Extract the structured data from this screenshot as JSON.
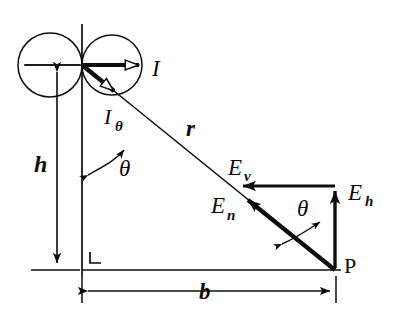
{
  "figure": {
    "type": "vector-geometry-diagram",
    "stroke_color": "#0d0d0d",
    "background_color": "#ffffff",
    "labels": {
      "current": "I",
      "current_theta_base": "I",
      "current_theta_sub": "θ",
      "radius": "r",
      "angle_upper": "θ",
      "angle_lower": "θ",
      "height": "h",
      "baseline": "b",
      "point": "P",
      "field_vertical_base": "E",
      "field_vertical_sub": "v",
      "field_normal_base": "E",
      "field_normal_sub": "n",
      "field_horizontal_base": "E",
      "field_horizontal_sub": "h",
      "right_angle_marker": "L"
    },
    "geometry": {
      "origin": {
        "x": 82,
        "y": 65
      },
      "point_p": {
        "x": 335,
        "y": 270
      },
      "corner": {
        "x": 82,
        "y": 270
      },
      "circle_left": {
        "cx": 50,
        "cy": 65,
        "r": 32
      },
      "circle_right": {
        "cx": 112,
        "cy": 65,
        "r": 30
      },
      "vector_corner": {
        "x": 335,
        "y": 186
      },
      "r_tip": {
        "x": 234,
        "y": 186
      },
      "en_tip": {
        "x": 240,
        "y": 198
      }
    }
  }
}
